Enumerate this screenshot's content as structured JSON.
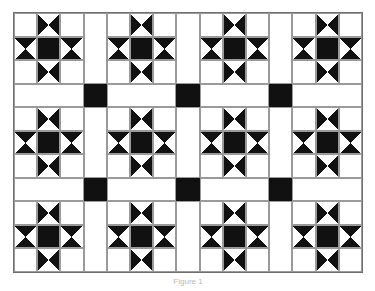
{
  "figure": {
    "caption": "Figure 1",
    "background_color": "#ffffff",
    "canvas": {
      "width": 375,
      "height": 291
    }
  },
  "quilt": {
    "frame": {
      "x": 13,
      "y": 12,
      "width": 350,
      "height": 261,
      "border_width": 1,
      "border_color": "#6f6f6f",
      "background_color": "#ffffff"
    },
    "colors": {
      "dark": "#111111",
      "light": "#ffffff",
      "seam_line": "#9a9a9a"
    },
    "layout": {
      "block_rows": 3,
      "block_cols": 4,
      "block_units": 3,
      "sashing": true,
      "cornerstones": true,
      "block_size_fr": 3,
      "sash_size_fr": 1
    },
    "legend": [
      {
        "swatch": "dark",
        "label": "Dark fabric"
      },
      {
        "swatch": "light",
        "label": "Light fabric"
      }
    ],
    "block": {
      "name": "Ohio Star",
      "unit_grid": [
        [
          "corner-light",
          "hourglass-horizontal",
          "corner-light"
        ],
        [
          "hourglass-vertical",
          "center-dark",
          "hourglass-vertical"
        ],
        [
          "corner-light",
          "hourglass-horizontal",
          "corner-light"
        ]
      ]
    },
    "cornerstone_color": "#111111",
    "sashing_color": "#ffffff"
  }
}
